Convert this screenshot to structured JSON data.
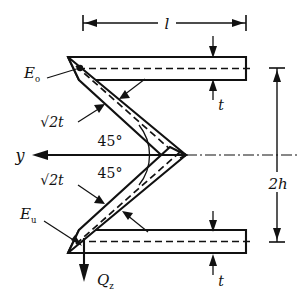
{
  "figure": {
    "colors": {
      "line": "#111111",
      "background": "#ffffff"
    },
    "labels": {
      "length_l": "l",
      "height_2h": "2h",
      "thickness_top": "t",
      "thickness_bottom": "t",
      "web_thickness_upper": "√2t",
      "web_thickness_lower": "√2t",
      "angle_upper": "45°",
      "angle_lower": "45°",
      "axis_y": "y",
      "shear_force": "Q",
      "shear_force_sub": "z",
      "point_upper": "E",
      "point_upper_sub": "o",
      "point_lower": "E",
      "point_lower_sub": "u"
    },
    "dimensions": {
      "l_span": "l",
      "h_span": "2h"
    },
    "icons": {
      "arrow_left": "y-axis-arrow",
      "arrow_down": "shear-force-arrow",
      "centerline": "dash-dot-centerline"
    }
  }
}
